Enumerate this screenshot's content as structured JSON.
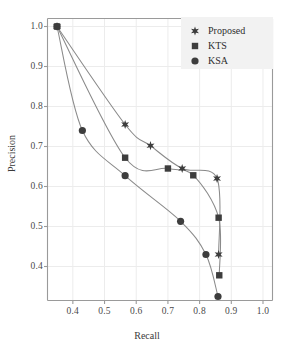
{
  "chart_data": {
    "type": "line",
    "title": "",
    "xlabel": "Recall",
    "ylabel": "Precision",
    "xlim": [
      0.32,
      1.03
    ],
    "ylim": [
      0.315,
      1.02
    ],
    "xticks": [
      "0.4",
      "0.5",
      "0.6",
      "0.7",
      "0.8",
      "0.9",
      "1.0"
    ],
    "xtick_values": [
      0.4,
      0.5,
      0.6,
      0.7,
      0.8,
      0.9,
      1.0
    ],
    "yticks": [
      "0.4",
      "0.5",
      "0.6",
      "0.7",
      "0.8",
      "0.9",
      "1.0"
    ],
    "ytick_values": [
      0.4,
      0.5,
      0.6,
      0.7,
      0.8,
      0.9,
      1.0
    ],
    "grid": true,
    "legend_position": "top-right",
    "line_color": "#8a8a8a",
    "marker_color": "#3d3d3d",
    "axis_color": "#9a9a9a",
    "grid_color": "#ececec",
    "legend_bg": "#f2f2f2",
    "series": [
      {
        "name": "Proposed",
        "marker": "star",
        "x": [
          0.35,
          0.565,
          0.645,
          0.745,
          0.855,
          0.86
        ],
        "y": [
          1.0,
          0.755,
          0.702,
          0.645,
          0.62,
          0.43
        ]
      },
      {
        "name": "KTS",
        "marker": "square",
        "x": [
          0.35,
          0.565,
          0.7,
          0.78,
          0.86,
          0.862
        ],
        "y": [
          1.0,
          0.672,
          0.645,
          0.628,
          0.522,
          0.378
        ]
      },
      {
        "name": "KSA",
        "marker": "circle",
        "x": [
          0.35,
          0.43,
          0.565,
          0.74,
          0.82,
          0.858
        ],
        "y": [
          1.0,
          0.74,
          0.627,
          0.513,
          0.43,
          0.325
        ]
      }
    ]
  },
  "legend": {
    "items": [
      {
        "label": "Proposed",
        "marker": "star-marker"
      },
      {
        "label": "KTS",
        "marker": "square-marker"
      },
      {
        "label": "KSA",
        "marker": "circle-marker"
      }
    ]
  }
}
